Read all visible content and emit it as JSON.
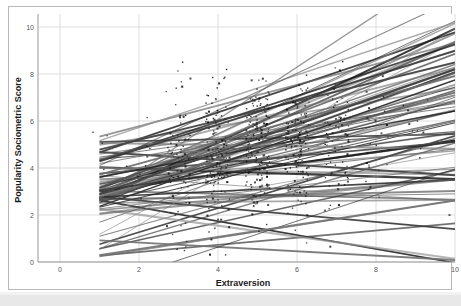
{
  "chart_data": {
    "type": "scatter",
    "title": "",
    "xlabel": "Extraversion",
    "ylabel": "Popularity Sociometric Score",
    "xlim": [
      -0.5,
      10.2
    ],
    "ylim": [
      -0.2,
      11.0
    ],
    "xticks": [
      0,
      2,
      4,
      6,
      8,
      10
    ],
    "xtick_labels": [
      "0",
      "2",
      "4",
      "6",
      "8",
      "10"
    ],
    "yticks": [
      0,
      2,
      4,
      6,
      8,
      10
    ],
    "ytick_labels": [
      "0",
      "2",
      "4",
      "6",
      "8",
      "10"
    ],
    "grid": true,
    "grid_color": "#d6d6d6",
    "legend": "none",
    "point_color": "#1a1a1a",
    "line_color": "#333333",
    "series": [
      {
        "name": "Raw observations",
        "marker": "dot",
        "clusters": [
          {
            "x": 1,
            "n": 4,
            "y_mean": 4.2,
            "y_sd": 1.4
          },
          {
            "x": 2,
            "n": 10,
            "y_mean": 4.1,
            "y_sd": 1.5
          },
          {
            "x": 3,
            "n": 70,
            "y_mean": 4.3,
            "y_sd": 1.5
          },
          {
            "x": 4,
            "n": 130,
            "y_mean": 4.5,
            "y_sd": 1.5
          },
          {
            "x": 5,
            "n": 150,
            "y_mean": 4.8,
            "y_sd": 1.5
          },
          {
            "x": 6,
            "n": 120,
            "y_mean": 5.0,
            "y_sd": 1.5
          },
          {
            "x": 7,
            "n": 70,
            "y_mean": 5.2,
            "y_sd": 1.5
          },
          {
            "x": 8,
            "n": 24,
            "y_mean": 5.6,
            "y_sd": 1.5
          },
          {
            "x": 9,
            "n": 10,
            "y_mean": 5.3,
            "y_sd": 1.3
          },
          {
            "x": 10,
            "n": 4,
            "y_mean": 5.4,
            "y_sd": 1.2
          }
        ]
      },
      {
        "name": "Group regression lines",
        "marker": "line",
        "n_lines": 84,
        "x_start": 1.0,
        "x_end": 10.0,
        "intercept_mean": 3.1,
        "intercept_sd": 1.35,
        "slope_mean": 0.4,
        "slope_sd": 0.27
      }
    ]
  },
  "axes": {
    "x_title": "Extraversion",
    "y_title": "Popularity Sociometric Score"
  }
}
